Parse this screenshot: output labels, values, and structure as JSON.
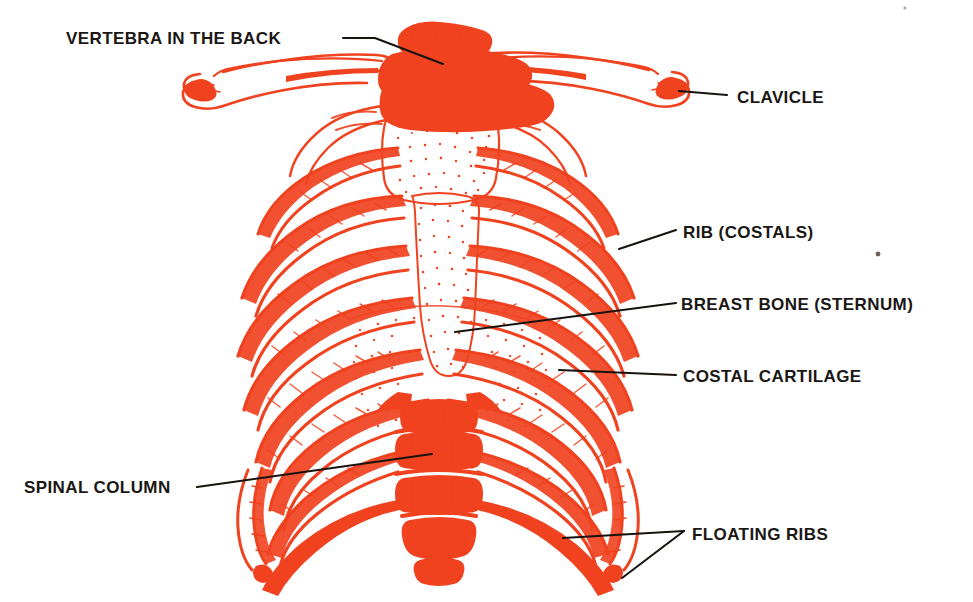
{
  "figure": {
    "ink_color": "#f0421f",
    "label_color": "#1a1714",
    "background_color": "#ffffff",
    "width": 973,
    "height": 602
  },
  "labels": [
    {
      "id": "vertebra",
      "text": "VERTEBRA IN THE BACK",
      "text_x": 66,
      "text_y": 44,
      "anchor": "start",
      "leader": "M 343 38 L 375 38 L 443 64"
    },
    {
      "id": "clavicle",
      "text": "CLAVICLE",
      "text_x": 737,
      "text_y": 103,
      "anchor": "start",
      "leader": "M 679 91 L 727 95"
    },
    {
      "id": "rib",
      "text": "RIB (COSTALS)",
      "text_x": 683,
      "text_y": 238,
      "anchor": "start",
      "leader": "M 619 249 L 676 230"
    },
    {
      "id": "sternum",
      "text": "BREAST BONE (STERNUM)",
      "text_x": 681,
      "text_y": 310,
      "anchor": "start",
      "leader": "M 455 332 L 676 303"
    },
    {
      "id": "costal-cartilage",
      "text": "COSTAL CARTILAGE",
      "text_x": 683,
      "text_y": 382,
      "anchor": "start",
      "leader": "M 559 370 L 676 375"
    },
    {
      "id": "spinal-column",
      "text": "SPINAL COLUMN",
      "text_x": 24,
      "text_y": 493,
      "anchor": "start",
      "leader": "M 197 487 L 432 454"
    },
    {
      "id": "floating-ribs",
      "text": "FLOATING RIBS",
      "text_x": 692,
      "text_y": 540,
      "anchor": "start",
      "leader": "M 563 538 L 684 531 M 684 531 L 622 578"
    }
  ],
  "artifacts": [
    {
      "id": "scan-speck",
      "x": 878,
      "y": 254,
      "r": 2.4
    },
    {
      "id": "scan-speck-top",
      "x": 905,
      "y": 8,
      "r": 1.6
    }
  ]
}
